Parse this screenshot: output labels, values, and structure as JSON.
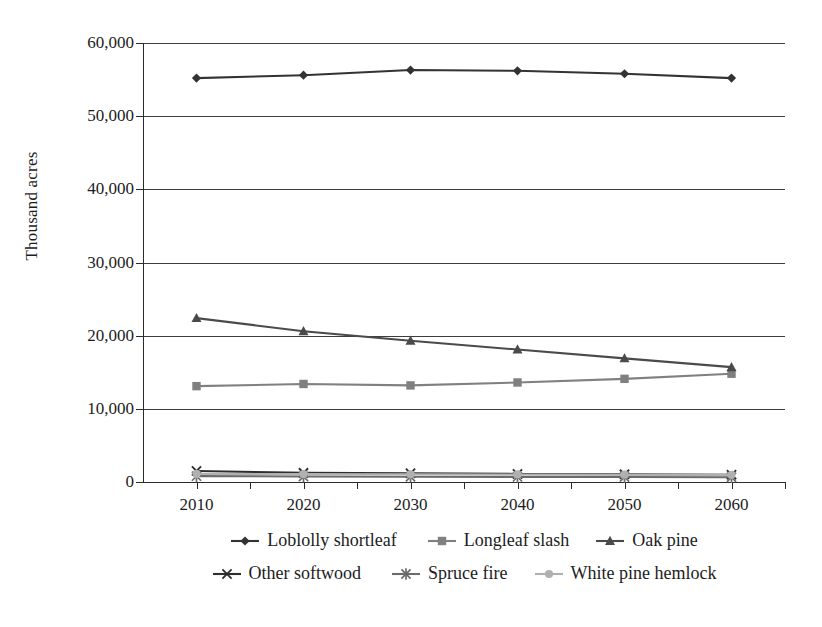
{
  "chart_data": {
    "type": "line",
    "title": "",
    "xlabel": "",
    "ylabel": "Thousand acres",
    "x": [
      2010,
      2020,
      2030,
      2040,
      2050,
      2060
    ],
    "categories": [
      "2010",
      "2020",
      "2030",
      "2040",
      "2050",
      "2060"
    ],
    "xtick_labels": [
      "2010",
      "2020",
      "2030",
      "2040",
      "2050",
      "2060"
    ],
    "ytick_labels": [
      "0",
      "10,000",
      "20,000",
      "30,000",
      "40,000",
      "50,000",
      "60,000"
    ],
    "ytick_values": [
      0,
      10000,
      20000,
      30000,
      40000,
      50000,
      60000
    ],
    "ylim": [
      0,
      60000
    ],
    "xlim": [
      2005,
      2065
    ],
    "grid": "horizontal",
    "legend_position": "bottom",
    "series": [
      {
        "name": "Loblolly shortleaf",
        "marker": "diamond",
        "color": "#333333",
        "values": [
          55200,
          55600,
          56300,
          56200,
          55800,
          55200
        ]
      },
      {
        "name": "Longleaf slash",
        "marker": "square",
        "color": "#808080",
        "values": [
          13100,
          13400,
          13200,
          13600,
          14100,
          14800
        ]
      },
      {
        "name": "Oak pine",
        "marker": "triangle",
        "color": "#4a4a4a",
        "values": [
          22400,
          20600,
          19300,
          18100,
          16900,
          15700
        ]
      },
      {
        "name": "Other softwood",
        "marker": "x",
        "color": "#2e2e2e",
        "values": [
          1500,
          1250,
          1200,
          1100,
          1050,
          1000
        ]
      },
      {
        "name": "Spruce fire",
        "marker": "asterisk",
        "color": "#6b6b6b",
        "values": [
          800,
          760,
          720,
          700,
          680,
          650
        ]
      },
      {
        "name": "White pine hemlock",
        "marker": "circle",
        "color": "#b0b0b0",
        "values": [
          1100,
          1080,
          1050,
          1030,
          1000,
          980
        ]
      }
    ]
  },
  "legend": {
    "rows": [
      [
        "Loblolly shortleaf",
        "Longleaf slash",
        "Oak pine"
      ],
      [
        "Other softwood",
        "Spruce fire",
        "White pine hemlock"
      ]
    ]
  }
}
